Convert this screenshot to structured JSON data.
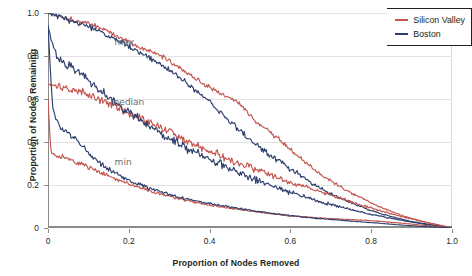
{
  "chart_data": {
    "type": "line",
    "title": "",
    "xlabel": "Proportion of Nodes Removed",
    "ylabel": "Proportion of Nodes Remaining",
    "xlim": [
      0,
      1.0
    ],
    "ylim": [
      0,
      1.0
    ],
    "xticks": [
      "0",
      "0.2",
      "0.4",
      "0.6",
      "0.8",
      "1.0"
    ],
    "xtick_values": [
      0,
      0.2,
      0.4,
      0.6,
      0.8,
      1.0
    ],
    "yticks": [
      "0",
      "0.2",
      "0.4",
      "0.6",
      "0.8",
      "1.0"
    ],
    "ytick_values": [
      0,
      0.2,
      0.4,
      0.6,
      0.8,
      1.0
    ],
    "grid": "horizontal",
    "legend_position": "top-right",
    "annotations": [
      {
        "text": "max",
        "x": 0.155,
        "y": 0.855
      },
      {
        "text": "median",
        "x": 0.145,
        "y": 0.575
      },
      {
        "text": "min",
        "x": 0.155,
        "y": 0.3
      }
    ],
    "legend": [
      {
        "name": "Silicon Valley",
        "color": "#c4564e"
      },
      {
        "name": "Boston",
        "color": "#2e3f6e"
      }
    ],
    "series": [
      {
        "name": "Silicon Valley max",
        "city": "Silicon Valley",
        "statistic": "max",
        "color": "#c4564e",
        "x": [
          0,
          0.01,
          0.02,
          0.03,
          0.04,
          0.05,
          0.06,
          0.07,
          0.08,
          0.09,
          0.1,
          0.11,
          0.12,
          0.13,
          0.14,
          0.15,
          0.16,
          0.17,
          0.18,
          0.19,
          0.2,
          0.22,
          0.24,
          0.26,
          0.28,
          0.29,
          0.3,
          0.31,
          0.32,
          0.33,
          0.34,
          0.35,
          0.36,
          0.37,
          0.38,
          0.39,
          0.4,
          0.42,
          0.44,
          0.46,
          0.47,
          0.48,
          0.49,
          0.5,
          0.52,
          0.54,
          0.56,
          0.58,
          0.6,
          0.62,
          0.64,
          0.66,
          0.68,
          0.7,
          0.72,
          0.74,
          0.76,
          0.78,
          0.8,
          0.82,
          0.84,
          0.86,
          0.88,
          0.9,
          0.92,
          0.94,
          0.96,
          0.98,
          1.0
        ],
        "y": [
          1.0,
          0.995,
          0.99,
          0.985,
          0.98,
          0.975,
          0.97,
          0.965,
          0.96,
          0.955,
          0.95,
          0.945,
          0.94,
          0.93,
          0.925,
          0.915,
          0.9,
          0.895,
          0.885,
          0.875,
          0.865,
          0.845,
          0.83,
          0.815,
          0.8,
          0.79,
          0.78,
          0.765,
          0.755,
          0.74,
          0.725,
          0.715,
          0.705,
          0.69,
          0.675,
          0.665,
          0.655,
          0.635,
          0.615,
          0.595,
          0.585,
          0.565,
          0.545,
          0.52,
          0.49,
          0.46,
          0.43,
          0.4,
          0.365,
          0.33,
          0.3,
          0.27,
          0.245,
          0.22,
          0.195,
          0.175,
          0.155,
          0.135,
          0.115,
          0.1,
          0.085,
          0.07,
          0.055,
          0.045,
          0.035,
          0.025,
          0.017,
          0.008,
          0.0
        ]
      },
      {
        "name": "Boston max",
        "city": "Boston",
        "statistic": "max",
        "color": "#2e3f6e",
        "x": [
          0,
          0.01,
          0.02,
          0.03,
          0.04,
          0.05,
          0.06,
          0.07,
          0.08,
          0.09,
          0.1,
          0.11,
          0.12,
          0.13,
          0.14,
          0.15,
          0.16,
          0.17,
          0.18,
          0.19,
          0.2,
          0.22,
          0.24,
          0.26,
          0.28,
          0.29,
          0.3,
          0.31,
          0.32,
          0.33,
          0.34,
          0.35,
          0.36,
          0.37,
          0.38,
          0.39,
          0.4,
          0.42,
          0.44,
          0.46,
          0.48,
          0.5,
          0.52,
          0.54,
          0.56,
          0.58,
          0.6,
          0.62,
          0.64,
          0.66,
          0.68,
          0.7,
          0.72,
          0.74,
          0.76,
          0.78,
          0.8,
          0.82,
          0.84,
          0.86,
          0.88,
          0.9,
          0.92,
          0.94,
          0.96,
          0.98,
          1.0
        ],
        "y": [
          1.0,
          0.993,
          0.987,
          0.98,
          0.974,
          0.968,
          0.961,
          0.955,
          0.948,
          0.941,
          0.934,
          0.927,
          0.92,
          0.912,
          0.903,
          0.894,
          0.885,
          0.876,
          0.866,
          0.856,
          0.845,
          0.824,
          0.803,
          0.782,
          0.761,
          0.75,
          0.74,
          0.725,
          0.71,
          0.695,
          0.68,
          0.665,
          0.65,
          0.635,
          0.618,
          0.6,
          0.585,
          0.55,
          0.515,
          0.48,
          0.445,
          0.41,
          0.38,
          0.35,
          0.325,
          0.3,
          0.275,
          0.25,
          0.225,
          0.2,
          0.18,
          0.16,
          0.142,
          0.125,
          0.11,
          0.095,
          0.082,
          0.07,
          0.058,
          0.048,
          0.039,
          0.031,
          0.024,
          0.018,
          0.012,
          0.006,
          0.0
        ]
      },
      {
        "name": "Silicon Valley median",
        "city": "Silicon Valley",
        "statistic": "median",
        "color": "#c4564e",
        "x": [
          0,
          0.005,
          0.01,
          0.02,
          0.03,
          0.04,
          0.05,
          0.06,
          0.07,
          0.08,
          0.09,
          0.1,
          0.11,
          0.12,
          0.13,
          0.14,
          0.15,
          0.16,
          0.17,
          0.18,
          0.19,
          0.2,
          0.22,
          0.24,
          0.26,
          0.28,
          0.3,
          0.32,
          0.34,
          0.36,
          0.38,
          0.4,
          0.42,
          0.44,
          0.46,
          0.48,
          0.5,
          0.52,
          0.54,
          0.56,
          0.58,
          0.6,
          0.62,
          0.64,
          0.66,
          0.68,
          0.7,
          0.72,
          0.74,
          0.76,
          0.78,
          0.8,
          0.82,
          0.84,
          0.86,
          0.88,
          0.9,
          0.92,
          0.94,
          0.96,
          0.98,
          1.0
        ],
        "y": [
          0.665,
          0.665,
          0.663,
          0.66,
          0.657,
          0.652,
          0.648,
          0.643,
          0.638,
          0.632,
          0.626,
          0.62,
          0.613,
          0.606,
          0.598,
          0.59,
          0.582,
          0.573,
          0.564,
          0.555,
          0.546,
          0.537,
          0.518,
          0.5,
          0.482,
          0.464,
          0.446,
          0.428,
          0.41,
          0.393,
          0.376,
          0.359,
          0.343,
          0.327,
          0.311,
          0.296,
          0.281,
          0.266,
          0.252,
          0.238,
          0.225,
          0.212,
          0.2,
          0.188,
          0.176,
          0.164,
          0.152,
          0.14,
          0.128,
          0.116,
          0.104,
          0.093,
          0.082,
          0.071,
          0.061,
          0.051,
          0.042,
          0.033,
          0.025,
          0.017,
          0.009,
          0.0
        ]
      },
      {
        "name": "Boston median",
        "city": "Boston",
        "statistic": "median",
        "color": "#2e3f6e",
        "x": [
          0,
          0.005,
          0.01,
          0.015,
          0.02,
          0.03,
          0.04,
          0.05,
          0.06,
          0.07,
          0.08,
          0.09,
          0.1,
          0.11,
          0.12,
          0.13,
          0.14,
          0.15,
          0.16,
          0.17,
          0.18,
          0.19,
          0.2,
          0.22,
          0.24,
          0.26,
          0.28,
          0.3,
          0.32,
          0.34,
          0.36,
          0.38,
          0.4,
          0.42,
          0.44,
          0.46,
          0.48,
          0.5,
          0.52,
          0.54,
          0.56,
          0.58,
          0.6,
          0.62,
          0.64,
          0.66,
          0.68,
          0.7,
          0.72,
          0.74,
          0.76,
          0.78,
          0.8,
          0.82,
          0.84,
          0.86,
          0.88,
          0.9,
          0.92,
          0.94,
          0.96,
          0.98,
          1.0
        ],
        "y": [
          0.94,
          0.9,
          0.86,
          0.83,
          0.81,
          0.79,
          0.775,
          0.76,
          0.745,
          0.73,
          0.715,
          0.7,
          0.686,
          0.67,
          0.655,
          0.64,
          0.625,
          0.61,
          0.596,
          0.582,
          0.568,
          0.554,
          0.54,
          0.515,
          0.49,
          0.466,
          0.443,
          0.42,
          0.398,
          0.377,
          0.357,
          0.337,
          0.318,
          0.3,
          0.283,
          0.266,
          0.25,
          0.234,
          0.219,
          0.205,
          0.191,
          0.178,
          0.165,
          0.153,
          0.141,
          0.13,
          0.119,
          0.109,
          0.099,
          0.09,
          0.081,
          0.072,
          0.064,
          0.056,
          0.048,
          0.041,
          0.034,
          0.027,
          0.021,
          0.015,
          0.01,
          0.005,
          0.0
        ]
      },
      {
        "name": "Silicon Valley min",
        "city": "Silicon Valley",
        "statistic": "min",
        "color": "#c4564e",
        "x": [
          0,
          0.004,
          0.008,
          0.012,
          0.02,
          0.03,
          0.04,
          0.05,
          0.06,
          0.07,
          0.08,
          0.09,
          0.1,
          0.12,
          0.14,
          0.16,
          0.18,
          0.2,
          0.22,
          0.24,
          0.26,
          0.28,
          0.3,
          0.32,
          0.34,
          0.36,
          0.38,
          0.4,
          0.42,
          0.44,
          0.46,
          0.48,
          0.5,
          0.52,
          0.54,
          0.56,
          0.58,
          0.6,
          0.62,
          0.64,
          0.66,
          0.68,
          0.7,
          0.72,
          0.74,
          0.76,
          0.78,
          0.8,
          0.82,
          0.84,
          0.86,
          0.88,
          0.9,
          0.92,
          0.94,
          0.96,
          0.98,
          1.0
        ],
        "y": [
          0.6,
          0.45,
          0.345,
          0.34,
          0.335,
          0.33,
          0.326,
          0.32,
          0.314,
          0.307,
          0.3,
          0.292,
          0.284,
          0.268,
          0.252,
          0.236,
          0.221,
          0.206,
          0.192,
          0.179,
          0.167,
          0.156,
          0.146,
          0.137,
          0.129,
          0.121,
          0.114,
          0.107,
          0.101,
          0.095,
          0.089,
          0.084,
          0.079,
          0.074,
          0.069,
          0.065,
          0.061,
          0.057,
          0.054,
          0.051,
          0.048,
          0.046,
          0.044,
          0.042,
          0.04,
          0.038,
          0.036,
          0.034,
          0.031,
          0.028,
          0.025,
          0.022,
          0.018,
          0.014,
          0.011,
          0.008,
          0.004,
          0.0
        ]
      },
      {
        "name": "Boston min",
        "city": "Boston",
        "statistic": "min",
        "color": "#2e3f6e",
        "x": [
          0,
          0.004,
          0.008,
          0.012,
          0.02,
          0.03,
          0.04,
          0.05,
          0.06,
          0.07,
          0.08,
          0.09,
          0.1,
          0.12,
          0.14,
          0.16,
          0.18,
          0.2,
          0.22,
          0.24,
          0.26,
          0.28,
          0.3,
          0.32,
          0.34,
          0.36,
          0.38,
          0.4,
          0.42,
          0.44,
          0.46,
          0.48,
          0.5,
          0.52,
          0.54,
          0.56,
          0.58,
          0.6,
          0.62,
          0.64,
          0.66,
          0.68,
          0.7,
          0.72,
          0.74,
          0.76,
          0.78,
          0.8,
          0.82,
          0.84,
          0.86,
          0.88,
          0.9,
          0.92,
          0.94,
          0.96,
          0.98,
          1.0
        ],
        "y": [
          0.94,
          0.8,
          0.66,
          0.56,
          0.5,
          0.47,
          0.455,
          0.44,
          0.425,
          0.41,
          0.39,
          0.37,
          0.35,
          0.315,
          0.285,
          0.26,
          0.24,
          0.222,
          0.206,
          0.192,
          0.179,
          0.167,
          0.156,
          0.146,
          0.137,
          0.129,
          0.121,
          0.114,
          0.107,
          0.101,
          0.095,
          0.089,
          0.083,
          0.077,
          0.072,
          0.067,
          0.062,
          0.057,
          0.053,
          0.049,
          0.046,
          0.043,
          0.04,
          0.037,
          0.034,
          0.031,
          0.028,
          0.025,
          0.022,
          0.019,
          0.016,
          0.013,
          0.011,
          0.008,
          0.006,
          0.004,
          0.002,
          0.0
        ]
      }
    ]
  },
  "colors": {
    "silicon_valley": "#c4564e",
    "boston": "#2e3f6e",
    "grid": "#e3e3e3",
    "axis": "#8b8b8b",
    "text": "#231f20",
    "annotation": "#6b6b6b"
  }
}
